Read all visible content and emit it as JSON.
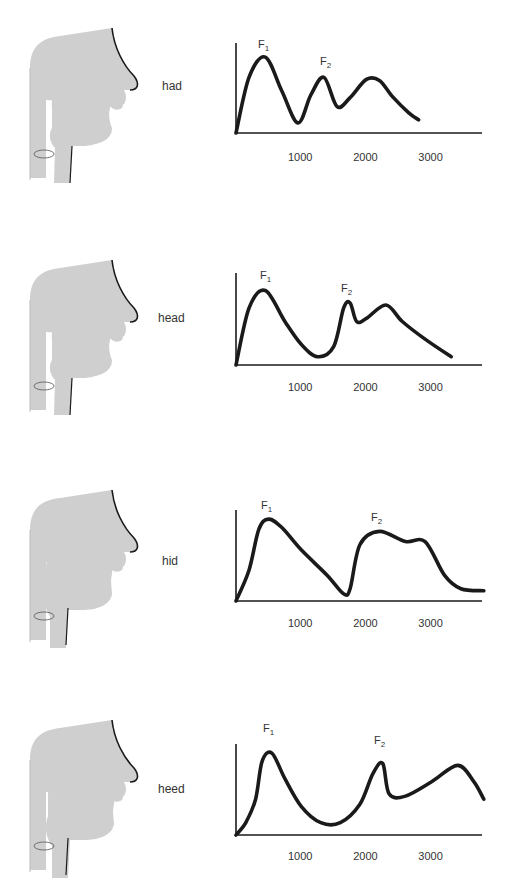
{
  "figure": {
    "panels": [
      {
        "word": "had",
        "f1_label": "F",
        "f1_sub": "1",
        "f2_label": "F",
        "f2_sub": "2"
      },
      {
        "word": "head",
        "f1_label": "F",
        "f1_sub": "1",
        "f2_label": "F",
        "f2_sub": "2"
      },
      {
        "word": "hid",
        "f1_label": "F",
        "f1_sub": "1",
        "f2_label": "F",
        "f2_sub": "2"
      },
      {
        "word": "heed",
        "f1_label": "F",
        "f1_sub": "1",
        "f2_label": "F",
        "f2_sub": "2"
      }
    ],
    "tick_labels": [
      "1000",
      "2000",
      "3000"
    ],
    "colors": {
      "tract_fill": "#cfcfcf",
      "tract_outline": "#1a1a1a",
      "curve": "#1a1a1a",
      "axis": "#1a1a1a"
    }
  },
  "chart_data": [
    {
      "type": "line",
      "title": "had",
      "xlabel": "Frequency (Hz)",
      "ylabel": "Amplitude",
      "x_ticks": [
        1000,
        2000,
        3000
      ],
      "xlim": [
        0,
        3800
      ],
      "grid": false,
      "annotations": [
        {
          "text": "F1",
          "x": 400
        },
        {
          "text": "F2",
          "x": 1350
        }
      ],
      "x": [
        0,
        200,
        450,
        700,
        950,
        1150,
        1350,
        1550,
        1750,
        2000,
        2200,
        2400,
        2650,
        2800
      ],
      "values": [
        0,
        55,
        75,
        42,
        10,
        38,
        55,
        26,
        35,
        53,
        52,
        36,
        20,
        13
      ]
    },
    {
      "type": "line",
      "title": "head",
      "xlabel": "Frequency (Hz)",
      "ylabel": "Amplitude",
      "x_ticks": [
        1000,
        2000,
        3000
      ],
      "xlim": [
        0,
        3800
      ],
      "grid": false,
      "annotations": [
        {
          "text": "F1",
          "x": 450
        },
        {
          "text": "F2",
          "x": 1750
        }
      ],
      "x": [
        0,
        200,
        450,
        750,
        1000,
        1250,
        1500,
        1650,
        1750,
        1850,
        2000,
        2300,
        2550,
        2900,
        3300
      ],
      "values": [
        0,
        55,
        72,
        42,
        20,
        8,
        18,
        55,
        60,
        42,
        45,
        58,
        42,
        25,
        8
      ]
    },
    {
      "type": "line",
      "title": "hid",
      "xlabel": "Frequency (Hz)",
      "ylabel": "Amplitude",
      "x_ticks": [
        1000,
        2000,
        3000
      ],
      "xlim": [
        0,
        3800
      ],
      "grid": false,
      "annotations": [
        {
          "text": "F1",
          "x": 450
        },
        {
          "text": "F2",
          "x": 2200
        }
      ],
      "x": [
        0,
        200,
        350,
        500,
        700,
        1000,
        1400,
        1650,
        1750,
        1900,
        2200,
        2600,
        2900,
        3200,
        3450,
        3800
      ],
      "values": [
        0,
        30,
        70,
        80,
        72,
        50,
        25,
        7,
        12,
        55,
        68,
        58,
        58,
        25,
        12,
        10
      ]
    },
    {
      "type": "line",
      "title": "heed",
      "xlabel": "Frequency (Hz)",
      "ylabel": "Amplitude",
      "x_ticks": [
        1000,
        2000,
        3000
      ],
      "xlim": [
        0,
        3800
      ],
      "grid": false,
      "annotations": [
        {
          "text": "F1",
          "x": 500
        },
        {
          "text": "F2",
          "x": 2250
        }
      ],
      "x": [
        0,
        150,
        300,
        400,
        550,
        750,
        1000,
        1300,
        1600,
        1900,
        2100,
        2250,
        2350,
        2600,
        3000,
        3400,
        3650,
        3800
      ],
      "values": [
        0,
        12,
        35,
        72,
        80,
        55,
        28,
        12,
        12,
        30,
        60,
        70,
        40,
        38,
        52,
        68,
        52,
        35
      ]
    }
  ]
}
